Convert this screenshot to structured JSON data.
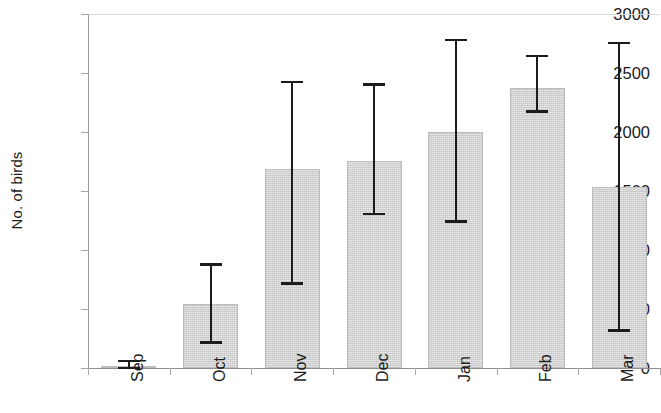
{
  "chart_data": {
    "type": "bar",
    "title": "",
    "subtitle": "",
    "xlabel": "",
    "ylabel": "No. of birds",
    "categories": [
      "Sep",
      "Oct",
      "Nov",
      "Dec",
      "Jan",
      "Feb",
      "Mar"
    ],
    "values": [
      15,
      545,
      1685,
      1755,
      2000,
      2370,
      1530
    ],
    "error_low": [
      0,
      215,
      715,
      1305,
      1240,
      2175,
      320
    ],
    "error_high": [
      60,
      875,
      2425,
      2405,
      2780,
      2645,
      2755
    ],
    "ylim": [
      0,
      3000
    ],
    "yticks": [
      0,
      500,
      1000,
      1500,
      2000,
      2500,
      3000
    ],
    "ytick_labels": [
      "0",
      "500",
      "1000",
      "1500",
      "2000",
      "2500",
      "3000"
    ],
    "grid": false,
    "legend": null,
    "series": [
      {
        "name": "No. of birds",
        "values": [
          15,
          545,
          1685,
          1755,
          2000,
          2370,
          1530
        ]
      }
    ],
    "bar_color": "#d2d2d2",
    "bar_edge_color": "#bdbdbd",
    "error_bar_color": "#1c1c1c",
    "axis_color": "#8f8f8f",
    "text_color": "#1b1b1b"
  }
}
